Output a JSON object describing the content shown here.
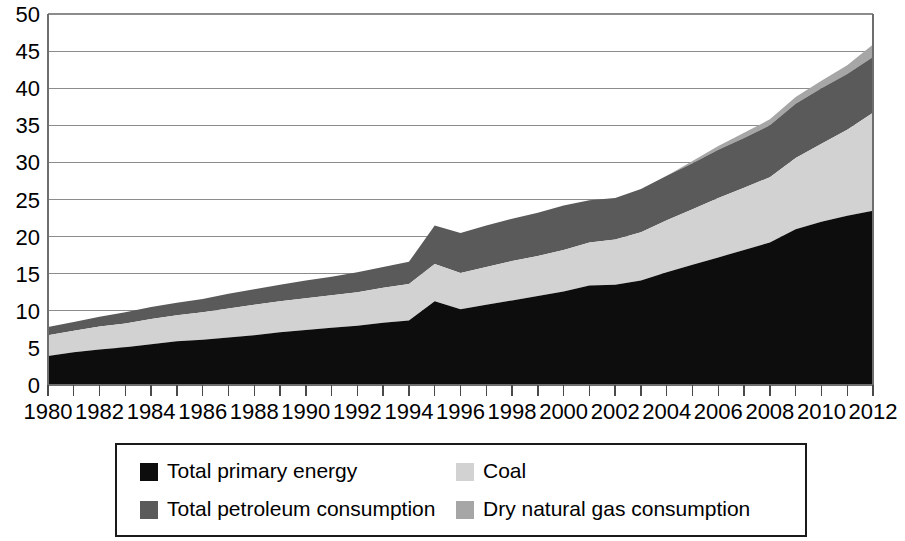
{
  "chart_data": {
    "type": "area",
    "stacked": true,
    "title": "",
    "subtitle": "",
    "xlabel": "",
    "ylabel": "",
    "grid": true,
    "legend_position": "bottom",
    "xlim": [
      1980,
      2012
    ],
    "ylim": [
      0,
      50
    ],
    "y_ticks": [
      0,
      5,
      10,
      15,
      20,
      25,
      30,
      35,
      40,
      45,
      50
    ],
    "y_tick_labels": [
      "0",
      "5",
      "10",
      "15",
      "20",
      "25",
      "30",
      "35",
      "40",
      "45",
      "50"
    ],
    "x": [
      1980,
      1981,
      1982,
      1983,
      1984,
      1985,
      1986,
      1987,
      1988,
      1989,
      1990,
      1991,
      1992,
      1993,
      1994,
      1995,
      1996,
      1997,
      1998,
      1999,
      2000,
      2001,
      2002,
      2003,
      2004,
      2005,
      2006,
      2007,
      2008,
      2009,
      2010,
      2011,
      2012
    ],
    "x_tick_labels": [
      "1980",
      "1982",
      "1984",
      "1986",
      "1988",
      "1990",
      "1992",
      "1994",
      "1996",
      "1998",
      "2000",
      "2002",
      "2004",
      "2006",
      "2008",
      "2010",
      "2012"
    ],
    "x_tick_values": [
      1980,
      1982,
      1984,
      1986,
      1988,
      1990,
      1992,
      1994,
      1996,
      1998,
      2000,
      2002,
      2004,
      2006,
      2008,
      2010,
      2012
    ],
    "x_minor_ticks": [
      1980,
      1981,
      1982,
      1983,
      1984,
      1985,
      1986,
      1987,
      1988,
      1989,
      1990,
      1991,
      1992,
      1993,
      1994,
      1995,
      1996,
      1997,
      1998,
      1999,
      2000,
      2001,
      2002,
      2003,
      2004,
      2005,
      2006,
      2007,
      2008,
      2009,
      2010,
      2011,
      2012
    ],
    "series": [
      {
        "name": "Total primary energy",
        "color": "#0d0d0d",
        "values": [
          3.9,
          4.4,
          4.8,
          5.1,
          5.5,
          5.9,
          6.1,
          6.4,
          6.7,
          7.1,
          7.4,
          7.7,
          8.0,
          8.4,
          8.7,
          11.3,
          10.2,
          10.8,
          11.4,
          12.0,
          12.6,
          13.4,
          13.5,
          14.1,
          15.2,
          16.2,
          17.2,
          18.2,
          19.2,
          21.0,
          22.0,
          22.8,
          23.5
        ]
      },
      {
        "name": "Coal",
        "color": "#d2d2d2",
        "values": [
          2.8,
          2.9,
          3.1,
          3.2,
          3.4,
          3.5,
          3.7,
          3.9,
          4.1,
          4.2,
          4.3,
          4.4,
          4.5,
          4.7,
          4.9,
          5.0,
          4.9,
          5.1,
          5.3,
          5.4,
          5.6,
          5.8,
          6.1,
          6.5,
          7.0,
          7.5,
          8.0,
          8.4,
          8.8,
          9.6,
          10.5,
          11.6,
          13.2
        ]
      },
      {
        "name": "Total petroleum consumption",
        "color": "#5a5a5a",
        "values": [
          1.1,
          1.2,
          1.3,
          1.5,
          1.6,
          1.7,
          1.8,
          2.0,
          2.1,
          2.2,
          2.4,
          2.5,
          2.7,
          2.8,
          3.0,
          5.2,
          5.4,
          5.6,
          5.7,
          5.8,
          6.0,
          5.7,
          5.6,
          5.8,
          6.0,
          6.2,
          6.5,
          6.7,
          7.0,
          7.3,
          7.5,
          7.5,
          7.5
        ]
      },
      {
        "name": "Dry natural gas consumption",
        "color": "#a6a6a6",
        "values": [
          0.0,
          0.0,
          0.0,
          0.0,
          0.0,
          0.0,
          0.0,
          0.0,
          0.0,
          0.0,
          0.0,
          0.0,
          0.0,
          0.0,
          0.0,
          0.0,
          0.0,
          0.0,
          0.0,
          0.0,
          0.0,
          0.0,
          0.0,
          0.0,
          0.0,
          0.3,
          0.5,
          0.7,
          0.8,
          0.9,
          1.0,
          1.2,
          1.7
        ]
      }
    ]
  },
  "legend": {
    "entries": [
      {
        "label": "Total primary energy",
        "color": "#0d0d0d"
      },
      {
        "label": "Coal",
        "color": "#d2d2d2"
      },
      {
        "label": "Total petroleum consumption",
        "color": "#5a5a5a"
      },
      {
        "label": "Dry natural gas consumption",
        "color": "#a6a6a6"
      }
    ]
  }
}
